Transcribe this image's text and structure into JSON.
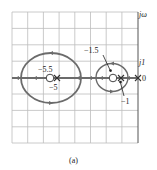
{
  "figure": {
    "caption": "(a)",
    "type": "root-locus",
    "axis_labels": {
      "imag": "jω",
      "imag_tick": "j1",
      "origin": "0"
    },
    "colors": {
      "locus": "#6b6b6b",
      "grid": "#bdbdbd",
      "axis": "#555555",
      "text": "#222222"
    },
    "annotations": [
      {
        "label": "−5.5",
        "kind": "zero",
        "real": -5.5
      },
      {
        "label": "−5",
        "kind": "pole",
        "real": -5
      },
      {
        "label": "−1.5",
        "kind": "zero",
        "real": -1.5
      },
      {
        "label": "−1",
        "kind": "pole",
        "real": -1
      },
      {
        "label": "0",
        "kind": "pole",
        "real": 0
      }
    ]
  }
}
